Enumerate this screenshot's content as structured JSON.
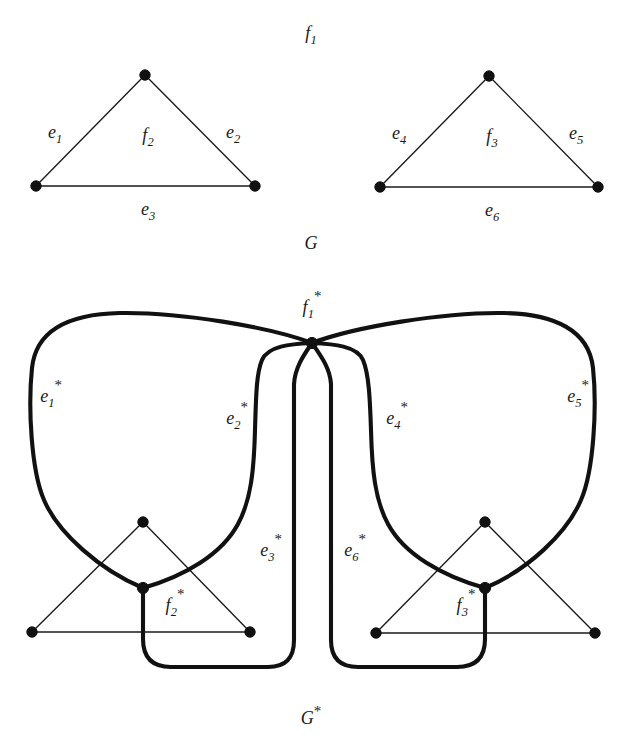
{
  "figure": {
    "caption_top": "G",
    "caption_bottom": "G*",
    "bottom_caption_base": "G",
    "bottom_caption_star": "*"
  },
  "top_graph": {
    "name": "G",
    "outer_face_label": {
      "base": "f",
      "sub": "1"
    },
    "left_triangle": {
      "face_label": {
        "base": "f",
        "sub": "2"
      },
      "edges": [
        {
          "base": "e",
          "sub": "1"
        },
        {
          "base": "e",
          "sub": "2"
        },
        {
          "base": "e",
          "sub": "3"
        }
      ]
    },
    "right_triangle": {
      "face_label": {
        "base": "f",
        "sub": "3"
      },
      "edges": [
        {
          "base": "e",
          "sub": "4"
        },
        {
          "base": "e",
          "sub": "5"
        },
        {
          "base": "e",
          "sub": "6"
        }
      ]
    }
  },
  "dual_graph": {
    "name": "G*",
    "outer_vertex_label": {
      "base": "f",
      "sub": "1",
      "star": "*"
    },
    "left_face_vertex_label": {
      "base": "f",
      "sub": "2",
      "star": "*"
    },
    "right_face_vertex_label": {
      "base": "f",
      "sub": "3",
      "star": "*"
    },
    "dual_edges": [
      {
        "base": "e",
        "sub": "1",
        "star": "*"
      },
      {
        "base": "e",
        "sub": "2",
        "star": "*"
      },
      {
        "base": "e",
        "sub": "3",
        "star": "*"
      },
      {
        "base": "e",
        "sub": "4",
        "star": "*"
      },
      {
        "base": "e",
        "sub": "5",
        "star": "*"
      },
      {
        "base": "e",
        "sub": "6",
        "star": "*"
      }
    ]
  },
  "colors": {
    "ink": "#1a1a1a",
    "thick_ink": "#111111",
    "background": "#ffffff"
  }
}
